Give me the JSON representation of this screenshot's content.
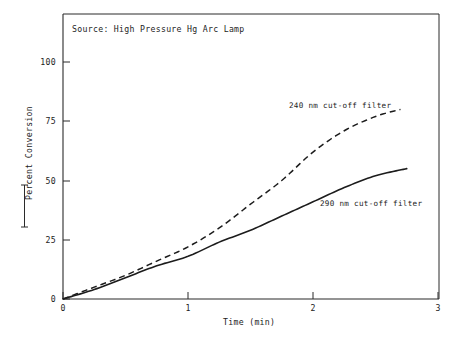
{
  "figure": {
    "source_note": "Source: High Pressure Hg Arc Lamp",
    "axis_bracket": "[   ]"
  },
  "chart_data": {
    "type": "line",
    "title": "",
    "subtitle": "Source: High Pressure Hg Arc Lamp",
    "xlabel": "Time (min)",
    "ylabel": "Percent Conversion",
    "xlim": [
      0,
      3
    ],
    "ylim": [
      0,
      112
    ],
    "xticks": [
      0,
      1,
      2,
      3
    ],
    "xtick_labels": [
      "0",
      "1",
      "2",
      "3"
    ],
    "yticks": [
      0,
      25,
      50,
      75,
      100
    ],
    "ytick_labels": [
      "0",
      "25",
      "50",
      "75",
      "100"
    ],
    "grid": false,
    "legend_position": "inline-annotations",
    "annotations": [
      {
        "text": "240 nm cut-off filter",
        "x": 2.0,
        "y": 85
      },
      {
        "text": "290 nm cut-off filter",
        "x": 2.2,
        "y": 44
      }
    ],
    "series": [
      {
        "name": "240 nm cut-off filter",
        "style": "dashed",
        "color": "#1c1c1c",
        "x": [
          0.0,
          0.25,
          0.5,
          0.75,
          1.0,
          1.25,
          1.5,
          1.75,
          2.0,
          2.25,
          2.5,
          2.7
        ],
        "y": [
          0,
          5,
          10,
          16,
          22,
          30,
          40,
          50,
          62,
          71,
          77,
          80
        ]
      },
      {
        "name": "290 nm cut-off filter",
        "style": "solid",
        "color": "#1c1c1c",
        "x": [
          0.0,
          0.25,
          0.5,
          0.75,
          1.0,
          1.25,
          1.5,
          1.75,
          2.0,
          2.25,
          2.5,
          2.75
        ],
        "y": [
          0,
          4,
          9,
          14,
          18,
          24,
          29,
          35,
          41,
          47,
          52,
          55
        ]
      }
    ]
  }
}
